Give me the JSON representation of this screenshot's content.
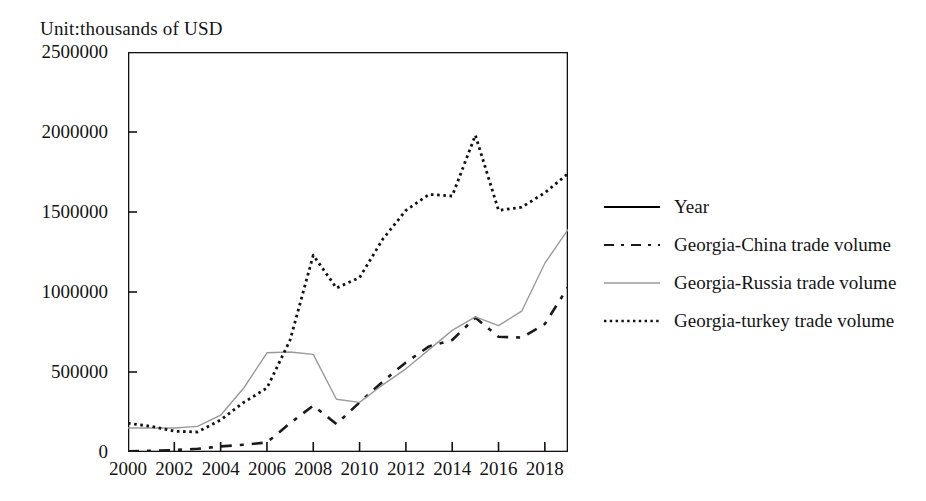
{
  "title": "Unit:thousands of  USD",
  "legend": {
    "position": "right",
    "items": [
      {
        "label": "Year",
        "style": "solid",
        "color": "#000000",
        "icon": "solid-line-swatch"
      },
      {
        "label": "Georgia-China trade volume",
        "style": "dashed",
        "color": "#1a1a1a",
        "icon": "dashed-line-swatch"
      },
      {
        "label": "Georgia-Russia trade volume",
        "style": "solid-thin",
        "color": "#9a9a9a",
        "icon": "gray-line-swatch"
      },
      {
        "label": "Georgia-turkey trade volume",
        "style": "dotted",
        "color": "#111111",
        "icon": "dotted-line-swatch"
      }
    ]
  },
  "chart_data": {
    "type": "line",
    "title": "Unit:thousands of  USD",
    "xlabel": "",
    "ylabel": "Unit:thousands of  USD",
    "grid": false,
    "xlim": [
      2000,
      2019
    ],
    "ylim": [
      0,
      2500000
    ],
    "ytick_labels": [
      "0",
      "500000",
      "1000000",
      "1500000",
      "2000000",
      "2500000"
    ],
    "yticks": [
      0,
      500000,
      1000000,
      1500000,
      2000000,
      2500000
    ],
    "xtick_labels": [
      "2000",
      "2002",
      "2004",
      "2006",
      "2008",
      "2010",
      "2012",
      "2014",
      "2016",
      "2018"
    ],
    "xticks": [
      2000,
      2002,
      2004,
      2006,
      2008,
      2010,
      2012,
      2014,
      2016,
      2018
    ],
    "x": [
      2000,
      2001,
      2002,
      2003,
      2004,
      2005,
      2006,
      2007,
      2008,
      2009,
      2010,
      2011,
      2012,
      2013,
      2014,
      2015,
      2016,
      2017,
      2018,
      2019
    ],
    "series": [
      {
        "name": "Georgia-China trade volume",
        "style": "dashed",
        "color": "#1a1a1a",
        "values": [
          5000,
          8000,
          12000,
          20000,
          35000,
          45000,
          60000,
          180000,
          290000,
          175000,
          310000,
          440000,
          560000,
          660000,
          700000,
          840000,
          720000,
          715000,
          800000,
          1030000
        ]
      },
      {
        "name": "Georgia-Russia trade volume",
        "style": "solid-thin",
        "color": "#9a9a9a",
        "values": [
          150000,
          150000,
          150000,
          160000,
          230000,
          400000,
          620000,
          625000,
          610000,
          330000,
          310000,
          420000,
          520000,
          640000,
          760000,
          845000,
          790000,
          880000,
          1180000,
          1390000
        ]
      },
      {
        "name": "Georgia-turkey trade volume",
        "style": "dotted",
        "color": "#111111",
        "values": [
          180000,
          160000,
          130000,
          125000,
          200000,
          310000,
          400000,
          700000,
          1230000,
          1025000,
          1090000,
          1330000,
          1510000,
          1610000,
          1600000,
          1980000,
          1510000,
          1530000,
          1620000,
          1740000
        ]
      }
    ]
  }
}
